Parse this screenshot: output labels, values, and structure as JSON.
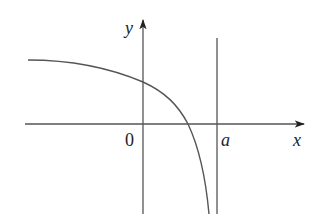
{
  "figure": {
    "axes": {
      "x_label": "x",
      "y_label": "y",
      "origin_label": "0"
    },
    "asymptote": {
      "label": "a",
      "description": "vertical asymptote x = a"
    },
    "curve": {
      "description": "decreasing concave-down curve, horizontal asymptote on the left, crosses positive y-axis, crosses x-axis between 0 and a, plunges to -infinity as x approaches a from the left"
    },
    "colors": {
      "line": "#555555",
      "text": "#222222",
      "background": "#ffffff"
    }
  }
}
